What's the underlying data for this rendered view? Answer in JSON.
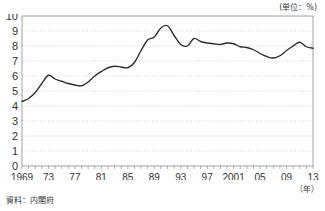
{
  "figure": {
    "top_cropped_text": "",
    "unit_label": "(単位：%)",
    "year_axis_unit": "（年）",
    "source_note": "資料：内閣府",
    "line_color": "#2b2b2b",
    "grid_color": "#b9b9b9",
    "axis_color": "#8c8c8c"
  },
  "chart_data": {
    "type": "line",
    "title": "",
    "subtitle": "",
    "xlabel": "（年）",
    "ylabel": "",
    "unit": "%",
    "xlim": [
      1969,
      2013
    ],
    "ylim": [
      0,
      10
    ],
    "ytick_step": 1,
    "yticks": [
      0,
      1,
      2,
      3,
      4,
      5,
      6,
      7,
      8,
      9,
      10
    ],
    "ytick_labels": [
      "0",
      "1",
      "2",
      "3",
      "4",
      "5",
      "6",
      "7",
      "8",
      "9",
      "10"
    ],
    "xticks": [
      1969,
      1973,
      1977,
      1981,
      1985,
      1989,
      1993,
      1997,
      2001,
      2005,
      2009,
      2013
    ],
    "xtick_labels": [
      "1969",
      "73",
      "77",
      "81",
      "85",
      "89",
      "93",
      "97",
      "2001",
      "05",
      "09",
      "13"
    ],
    "xtick_minor_step": 1,
    "grid": "horizontal-dotted",
    "legend": "none",
    "annotations": [],
    "x": [
      1969,
      1970,
      1971,
      1972,
      1973,
      1974,
      1975,
      1976,
      1977,
      1978,
      1979,
      1980,
      1981,
      1982,
      1983,
      1984,
      1985,
      1986,
      1987,
      1988,
      1989,
      1990,
      1991,
      1992,
      1993,
      1994,
      1995,
      1996,
      1997,
      1998,
      1999,
      2000,
      2001,
      2002,
      2003,
      2004,
      2005,
      2006,
      2007,
      2008,
      2009,
      2010,
      2011,
      2012,
      2013
    ],
    "values": [
      4.3,
      4.5,
      4.9,
      5.5,
      6.05,
      5.8,
      5.65,
      5.5,
      5.4,
      5.35,
      5.6,
      6.0,
      6.3,
      6.55,
      6.65,
      6.6,
      6.55,
      6.9,
      7.7,
      8.4,
      8.6,
      9.2,
      9.35,
      8.7,
      8.1,
      8.0,
      8.5,
      8.3,
      8.2,
      8.15,
      8.1,
      8.2,
      8.15,
      7.95,
      7.9,
      7.75,
      7.5,
      7.3,
      7.2,
      7.35,
      7.7,
      8.0,
      8.25,
      7.95,
      7.85
    ],
    "series": [
      {
        "name": "年次系列",
        "values": [
          4.3,
          4.5,
          4.9,
          5.5,
          6.05,
          5.8,
          5.65,
          5.5,
          5.4,
          5.35,
          5.6,
          6.0,
          6.3,
          6.55,
          6.65,
          6.6,
          6.55,
          6.9,
          7.7,
          8.4,
          8.6,
          9.2,
          9.35,
          8.7,
          8.1,
          8.0,
          8.5,
          8.3,
          8.2,
          8.15,
          8.1,
          8.2,
          8.15,
          7.95,
          7.9,
          7.75,
          7.5,
          7.3,
          7.2,
          7.35,
          7.7,
          8.0,
          8.25,
          7.95,
          7.85
        ]
      }
    ]
  }
}
